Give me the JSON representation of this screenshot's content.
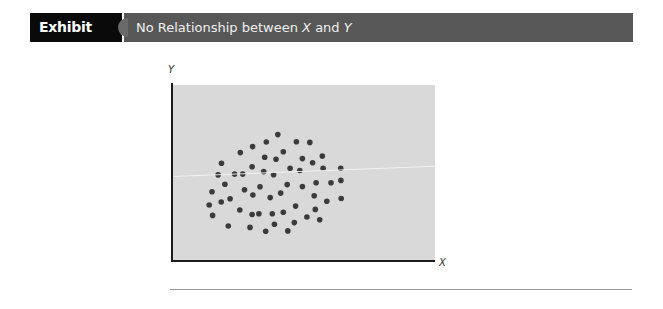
{
  "header": {
    "exhibit_number": "Exhibit 12.1",
    "title_parts": {
      "prefix": "No Relationship between ",
      "var_x": "X",
      "middle": " and ",
      "var_y": "Y"
    },
    "title": "No Relationship between X and Y"
  },
  "colors": {
    "label_bg": "#0a0a0a",
    "title_bg": "#575757",
    "plot_bg": "#d9d9d9",
    "dot": "#3b3b3b",
    "axis": "#1c1c1c"
  },
  "chart_data": {
    "type": "scatter",
    "title": "No Relationship between X and Y",
    "xlabel": "X",
    "ylabel": "Y",
    "xlim": [
      0,
      100
    ],
    "ylim": [
      0,
      100
    ],
    "grid": false,
    "legend": null,
    "tick_labels": false,
    "note": "Coordinates are relative positions (0-100) within the unlabeled plot area; axes have no ticks or numeric scale.",
    "points": [
      {
        "x": 40.0,
        "y": 71.8
      },
      {
        "x": 35.6,
        "y": 67.6
      },
      {
        "x": 47.1,
        "y": 67.8
      },
      {
        "x": 52.2,
        "y": 67.4
      },
      {
        "x": 30.4,
        "y": 65.0
      },
      {
        "x": 25.7,
        "y": 61.6
      },
      {
        "x": 42.1,
        "y": 62.1
      },
      {
        "x": 35.0,
        "y": 59.0
      },
      {
        "x": 39.3,
        "y": 57.8
      },
      {
        "x": 57.0,
        "y": 59.6
      },
      {
        "x": 49.4,
        "y": 58.2
      },
      {
        "x": 18.5,
        "y": 55.5
      },
      {
        "x": 30.2,
        "y": 53.6
      },
      {
        "x": 53.3,
        "y": 55.8
      },
      {
        "x": 57.3,
        "y": 52.7
      },
      {
        "x": 64.0,
        "y": 52.7
      },
      {
        "x": 44.7,
        "y": 52.7
      },
      {
        "x": 48.4,
        "y": 51.4
      },
      {
        "x": 34.6,
        "y": 50.8
      },
      {
        "x": 38.4,
        "y": 49.0
      },
      {
        "x": 17.2,
        "y": 48.9
      },
      {
        "x": 23.5,
        "y": 49.4
      },
      {
        "x": 26.6,
        "y": 49.4
      },
      {
        "x": 19.8,
        "y": 43.6
      },
      {
        "x": 54.6,
        "y": 44.5
      },
      {
        "x": 60.3,
        "y": 44.5
      },
      {
        "x": 64.1,
        "y": 45.8
      },
      {
        "x": 43.6,
        "y": 43.4
      },
      {
        "x": 49.4,
        "y": 42.3
      },
      {
        "x": 33.2,
        "y": 42.2
      },
      {
        "x": 27.3,
        "y": 40.5
      },
      {
        "x": 14.9,
        "y": 39.4
      },
      {
        "x": 41.1,
        "y": 38.6
      },
      {
        "x": 30.5,
        "y": 37.5
      },
      {
        "x": 53.9,
        "y": 37.1
      },
      {
        "x": 21.8,
        "y": 35.4
      },
      {
        "x": 37.1,
        "y": 36.0
      },
      {
        "x": 64.2,
        "y": 35.5
      },
      {
        "x": 18.4,
        "y": 33.5
      },
      {
        "x": 58.7,
        "y": 33.9
      },
      {
        "x": 13.8,
        "y": 31.8
      },
      {
        "x": 46.8,
        "y": 31.2
      },
      {
        "x": 25.5,
        "y": 29.0
      },
      {
        "x": 54.3,
        "y": 29.3
      },
      {
        "x": 30.2,
        "y": 26.4
      },
      {
        "x": 32.8,
        "y": 26.8
      },
      {
        "x": 37.9,
        "y": 26.9
      },
      {
        "x": 42.1,
        "y": 27.7
      },
      {
        "x": 15.1,
        "y": 25.9
      },
      {
        "x": 51.1,
        "y": 25.0
      },
      {
        "x": 56.0,
        "y": 23.4
      },
      {
        "x": 21.1,
        "y": 19.9
      },
      {
        "x": 29.4,
        "y": 19.1
      },
      {
        "x": 38.7,
        "y": 20.9
      },
      {
        "x": 46.3,
        "y": 21.8
      },
      {
        "x": 35.4,
        "y": 16.9
      },
      {
        "x": 43.8,
        "y": 17.1
      }
    ]
  }
}
